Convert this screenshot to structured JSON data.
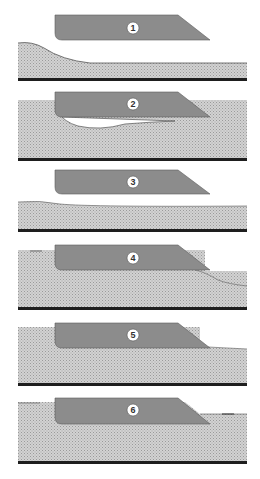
{
  "diagram": {
    "type": "sequential-stage-diagram",
    "stage_count": 6,
    "colors": {
      "background": "#ffffff",
      "blade_fill": "#8c8c8c",
      "blade_edge": "#5a5a5a",
      "sediment_fill": "#d2d2d2",
      "sediment_dot": "#9a9a9a",
      "base_layer": "#1e1e1e",
      "label_circle": "#ffffff",
      "label_text": "#333333"
    },
    "panels": [
      {
        "id": 1,
        "label": "1",
        "description": "Blade above sediment; sediment wedge slopes down from left"
      },
      {
        "id": 2,
        "label": "2",
        "description": "Blade embedded in sediment; void beneath blade"
      },
      {
        "id": 3,
        "label": "3",
        "description": "Blade lifted above nearly flat sediment"
      },
      {
        "id": 4,
        "label": "4",
        "description": "Blade embedded; sediment mound building ahead of blade tip"
      },
      {
        "id": 5,
        "label": "5",
        "description": "Blade embedded; sediment level ahead of blade"
      },
      {
        "id": 6,
        "label": "6",
        "description": "Blade embedded; flat sediment surface"
      }
    ]
  }
}
